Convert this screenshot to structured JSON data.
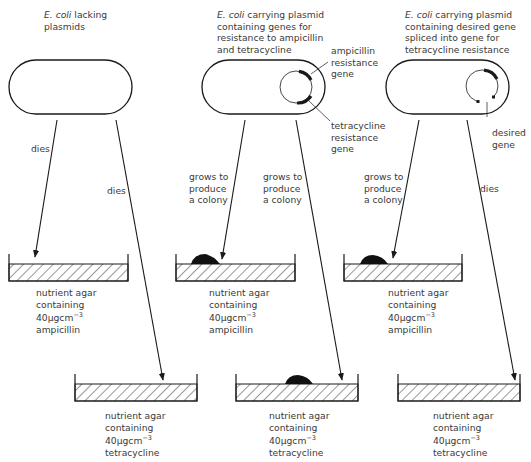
{
  "columns": [
    {
      "id": "no-plasmid",
      "title_italic": "E. coli",
      "title_rest": " lacking",
      "title_lines": [
        "plasmids"
      ],
      "has_plasmid": false,
      "ampicillin_outcome": "dies",
      "tetracycline_outcome": "dies",
      "ampicillin_colony": false,
      "tetracycline_colony": false
    },
    {
      "id": "plasmid-amp-tet",
      "title_italic": "E. coli",
      "title_rest": " carrying plasmid",
      "title_lines": [
        "containing genes for",
        "resistance to ampicillin",
        "and tetracycline"
      ],
      "has_plasmid": true,
      "plasmid_labels": {
        "ampicillin_gene": [
          "ampicillin",
          "resistance",
          "gene"
        ],
        "tetracycline_gene": [
          "tetracycline",
          "resistance",
          "gene"
        ]
      },
      "ampicillin_outcome": [
        "grows to",
        "produce",
        "a colony"
      ],
      "tetracycline_outcome": [
        "grows to",
        "produce",
        "a colony"
      ],
      "ampicillin_colony": true,
      "tetracycline_colony": true
    },
    {
      "id": "plasmid-desired-gene",
      "title_italic": "E. coli",
      "title_rest": " carrying plasmid",
      "title_lines": [
        "containing desired gene",
        "spliced into gene for",
        "tetracycline resistance"
      ],
      "has_plasmid": true,
      "plasmid_labels": {
        "desired_gene": [
          "desired",
          "gene"
        ]
      },
      "ampicillin_outcome": [
        "grows to",
        "produce",
        "a colony"
      ],
      "tetracycline_outcome": "dies",
      "ampicillin_colony": true,
      "tetracycline_colony": false
    }
  ],
  "agar_labels": {
    "ampicillin": {
      "line1": "nutrient agar",
      "line2": "containing",
      "conc_value": "40μgcm",
      "conc_exp": "−3",
      "line4": "ampicillin"
    },
    "tetracycline": {
      "line1": "nutrient agar",
      "line2": "containing",
      "conc_value": "40μgcm",
      "conc_exp": "−3",
      "line4": "tetracycline"
    }
  },
  "colors": {
    "ink": "#1a1a1a",
    "text": "#3a3a3a",
    "background": "#ffffff"
  }
}
